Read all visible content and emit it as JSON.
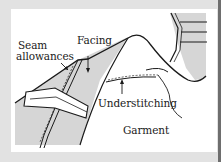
{
  "diagram": {
    "labels": {
      "seam_allowances_line1": "Seam",
      "seam_allowances_line2": "allowances",
      "facing": "Facing",
      "understitching": "Understitching",
      "garment": "Garment"
    },
    "colors": {
      "background": "#e2e2e2",
      "panel": "#ffffff",
      "shade": "#d6d6d6",
      "ink": "#1a1a1a"
    }
  }
}
